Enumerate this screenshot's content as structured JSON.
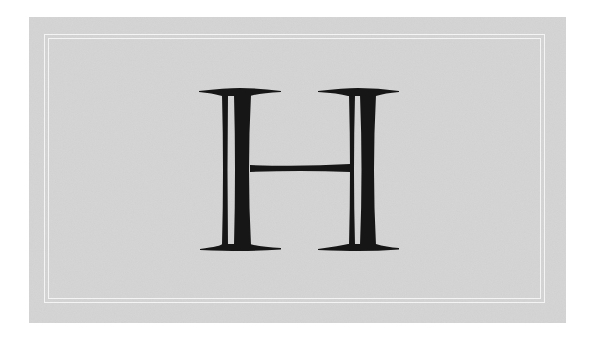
{
  "card": {
    "letter": "H",
    "background_color": "#d3d3d3",
    "frame_color": "#f4f4f4",
    "letter_color": "#161616",
    "style": "engraved inline serif capital"
  }
}
